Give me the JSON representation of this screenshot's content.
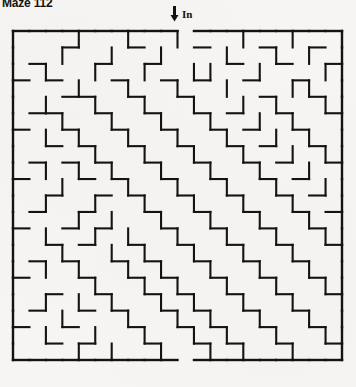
{
  "page": {
    "background_color": "#f6f5f3",
    "ink_color": "#131313",
    "width": 356,
    "height": 387
  },
  "title": {
    "text": "Maze 112"
  },
  "entrance": {
    "label": "In",
    "arrow_icon": "arrow-down-icon",
    "column": 10
  },
  "exit": {
    "column": 10,
    "side": "bottom"
  },
  "maze": {
    "type": "grid-maze",
    "cols": 20,
    "rows": 20,
    "origin_x": 13,
    "origin_y": 31,
    "cell_size": 16.45,
    "wall_color": "#131313",
    "wall_width": 2.1,
    "entrance_gap": {
      "edge": "top",
      "index": 10
    },
    "exit_gap": {
      "edge": "bottom",
      "index": 10
    },
    "h_walls": [
      "11111111110111111111",
      "00010001000100010010",
      "01000100100001001001",
      "10100010010100100100",
      "00011001001000010010",
      "01100100100101001001",
      "10010010010010100100",
      "00101001001001010010",
      "01010100100100101001",
      "10001010010010010100",
      "00100101001001001010",
      "01001000100100100101",
      "10010100010010010010",
      "00101001001001001001",
      "01010010100100100100",
      "10001001010010010010",
      "00100100101001001001",
      "01001010010100100100",
      "10010001001010010010",
      "00101000100101001001",
      "11111111110111111111"
    ],
    "v_walls": [
      "100010010010001001001",
      "100100100100010010101",
      "101001001001100100011",
      "100010010010010001101",
      "101001001001001010011",
      "100100100100100101001",
      "101010010010010010101",
      "100001001001001001011",
      "101010100100100100101",
      "100100010010010010011",
      "101001001001001001001",
      "100010100100100100101",
      "101001010010010010011",
      "100100101001001001001",
      "101010010100100100101",
      "100001001010010010011",
      "101010100101001001001",
      "100100010010100100101",
      "101001001001010010011",
      "100010100100101001001"
    ]
  }
}
